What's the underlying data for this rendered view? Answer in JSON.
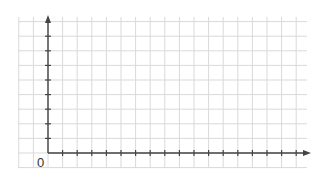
{
  "diagram": {
    "type": "coordinate-grid",
    "origin_label": "0",
    "colors": {
      "background": "#ffffff",
      "grid": "#d9d9d9",
      "axis": "#444444"
    },
    "grid": {
      "left": 18,
      "top": 17,
      "right": 307,
      "bottom": 168,
      "spacing": 14.6,
      "columns": 20,
      "rows": 10
    },
    "axes": {
      "origin_x": 48,
      "origin_y": 153,
      "x_axis_end": 311,
      "y_axis_end": 15,
      "x_ticks": 17,
      "y_ticks": 8,
      "tick_length": 6
    }
  }
}
